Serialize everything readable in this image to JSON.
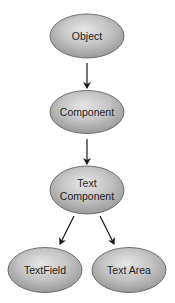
{
  "diagram": {
    "type": "class-hierarchy",
    "colors": {
      "node_fill_light": "#e4e4e4",
      "node_fill_dark": "#9a9a9a",
      "node_stroke": "#555555",
      "arrow": "#1a1a1a",
      "text": "#1e1e1e",
      "background": "#ffffff"
    },
    "nodes": [
      {
        "id": "object",
        "lines": [
          "Object"
        ],
        "cx": 87,
        "cy": 36,
        "rx": 37,
        "ry": 22
      },
      {
        "id": "component",
        "lines": [
          "Component"
        ],
        "cx": 87,
        "cy": 112,
        "rx": 37,
        "ry": 21.5
      },
      {
        "id": "text-component",
        "lines": [
          "Text",
          "Component"
        ],
        "cx": 87,
        "cy": 190,
        "rx": 37,
        "ry": 24
      },
      {
        "id": "textfield",
        "lines": [
          "TextField"
        ],
        "cx": 45,
        "cy": 270,
        "rx": 37,
        "ry": 22.5
      },
      {
        "id": "textarea",
        "lines": [
          "Text Area"
        ],
        "cx": 129,
        "cy": 270,
        "rx": 37,
        "ry": 22.5
      }
    ],
    "edges": [
      {
        "from": "object",
        "to": "component",
        "x1": 87,
        "y1": 63,
        "x2": 87,
        "y2": 88
      },
      {
        "from": "component",
        "to": "text-component",
        "x1": 87,
        "y1": 139,
        "x2": 87,
        "y2": 164
      },
      {
        "from": "text-component",
        "to": "textfield",
        "x1": 74,
        "y1": 216,
        "x2": 60,
        "y2": 244
      },
      {
        "from": "text-component",
        "to": "textarea",
        "x1": 100,
        "y1": 216,
        "x2": 114,
        "y2": 244
      }
    ],
    "labels": {
      "object": "Object",
      "component": "Component",
      "text_component_line1": "Text",
      "text_component_line2": "Component",
      "textfield": "TextField",
      "textarea": "Text Area"
    }
  }
}
